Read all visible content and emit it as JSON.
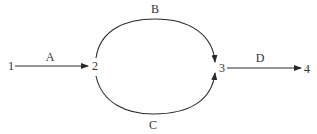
{
  "diagram": {
    "type": "network-graph",
    "nodes": [
      {
        "id": "1",
        "label": "1"
      },
      {
        "id": "2",
        "label": "2"
      },
      {
        "id": "3",
        "label": "3"
      },
      {
        "id": "4",
        "label": "4"
      }
    ],
    "edges": [
      {
        "id": "A",
        "label": "A",
        "from": "1",
        "to": "2",
        "shape": "straight"
      },
      {
        "id": "B",
        "label": "B",
        "from": "2",
        "to": "3",
        "shape": "upper-arc"
      },
      {
        "id": "C",
        "label": "C",
        "from": "2",
        "to": "3",
        "shape": "lower-arc"
      },
      {
        "id": "D",
        "label": "D",
        "from": "3",
        "to": "4",
        "shape": "straight"
      }
    ],
    "colors": {
      "line": "#2a2a2a",
      "text": "#333333",
      "background": "#ffffff"
    }
  }
}
